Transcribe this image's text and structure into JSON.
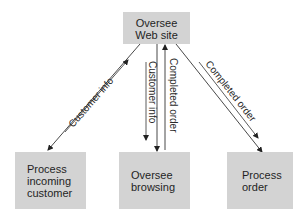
{
  "diagram": {
    "type": "flow",
    "nodes": {
      "top": {
        "lines": [
          "Oversee",
          "Web site"
        ]
      },
      "left": {
        "lines": [
          "Process",
          "incoming",
          "customer"
        ]
      },
      "middle": {
        "lines": [
          "Oversee",
          "browsing"
        ]
      },
      "right": {
        "lines": [
          "Process",
          "order"
        ]
      }
    },
    "edges": [
      {
        "from": "top",
        "to": "left",
        "label": "Customer info",
        "label_direction": "up"
      },
      {
        "from": "top",
        "to": "middle",
        "label": "Customer info",
        "label_direction": "down"
      },
      {
        "from": "middle",
        "to": "top",
        "label": "Completed order",
        "label_direction": "up"
      },
      {
        "from": "top",
        "to": "right",
        "label": "Completed order",
        "label_direction": "down"
      }
    ],
    "colors": {
      "box_fill": "#d3d3d3",
      "line": "#333333",
      "text": "#1f1f1f"
    }
  }
}
